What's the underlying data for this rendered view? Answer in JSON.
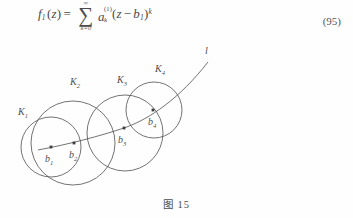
{
  "page": {
    "background_color": "#fefefe",
    "ink_color": "#4a4a4a"
  },
  "equation": {
    "number": "(95)",
    "lhs_function": "f",
    "lhs_function_sub": "1",
    "lhs_variable": "z",
    "equals": "=",
    "sum_symbol": "∑",
    "sum_upper": "∞",
    "sum_lower": "k=0",
    "coefficient": "a",
    "coefficient_sub": "k",
    "coefficient_sup": "(1)",
    "term_open": "(",
    "term_variable": "z",
    "term_minus": "−",
    "term_center": "b",
    "term_center_sub": "1",
    "term_close": ")",
    "term_exponent": "k",
    "plain_text": "f₁(z) = ∑(k=0..∞) aₖ^(1) (z − b₁)^k"
  },
  "figure": {
    "caption": "图 15",
    "line_label": "l",
    "circles": [
      {
        "name": "K",
        "sub": "1",
        "label_x": 18,
        "label_y": 75,
        "cx": 51,
        "cy": 107,
        "r": 30
      },
      {
        "name": "K",
        "sub": "2",
        "label_x": 70,
        "label_y": 45,
        "cx": 73,
        "cy": 103,
        "r": 42
      },
      {
        "name": "K",
        "sub": "3",
        "label_x": 117,
        "label_y": 43,
        "cx": 125,
        "cy": 93,
        "r": 38
      },
      {
        "name": "K",
        "sub": "4",
        "label_x": 155,
        "label_y": 32,
        "cx": 154,
        "cy": 70,
        "r": 28
      }
    ],
    "centers": [
      {
        "name": "b",
        "sub": "1",
        "x": 51,
        "y": 107,
        "label_x": 45,
        "label_y": 122
      },
      {
        "name": "b",
        "sub": "2",
        "x": 74,
        "y": 103,
        "label_x": 69,
        "label_y": 118
      },
      {
        "name": "b",
        "sub": "3",
        "x": 124,
        "y": 88,
        "label_x": 118,
        "label_y": 103
      },
      {
        "name": "b",
        "sub": "4",
        "x": 153,
        "y": 70,
        "label_x": 148,
        "label_y": 85
      }
    ],
    "curve_path": "M 38 110 C 70 104, 100 96, 124 88 C 150 79, 180 58, 208 22",
    "line_label_x": 205,
    "line_label_y": 14
  }
}
